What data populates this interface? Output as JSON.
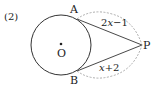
{
  "problem_number": "(2)",
  "points": {
    "center": "O",
    "tangent_point_top": "A",
    "tangent_point_bottom": "B",
    "external_point": "P"
  },
  "segment_labels": {
    "PA": {
      "coef": "2",
      "var": "x",
      "rest": "−1"
    },
    "PB": {
      "var": "x",
      "rest": "+2"
    }
  },
  "colors": {
    "stroke": "#333333",
    "dashed": "#999999"
  }
}
